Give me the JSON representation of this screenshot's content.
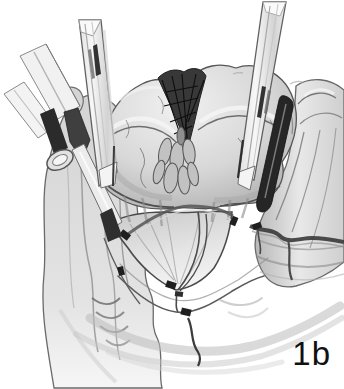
{
  "figure": {
    "label": "1b"
  },
  "illustration": {
    "description": "Grayscale hand-drawn surgical illustration: bilobed gland with dark hatched midline cleft, two tubular retractors, a clamp at upper left, a dark retractor blade at right, lateral tissue columns, fan-shaped flap with ligated vessels and surgical clips, sweeping pelvic tissue folds below",
    "elements": [
      "left-tissue-column",
      "right-tissue-column",
      "central-gland",
      "midline-incision-hatch",
      "fan-flap",
      "vessel-band",
      "surgical-clips",
      "left-clamp-instrument",
      "left-tube-retractor",
      "right-tube-retractor",
      "right-retractor-blade",
      "pelvic-floor-curves"
    ],
    "colors": {
      "background": "#ffffff",
      "outline_ink": "#4a4a4a",
      "dark_ink": "#1f1f1f",
      "tissue_light": "#efefef",
      "tissue_mid": "#c9c9c9",
      "tissue_shadow": "#8e8e8e",
      "label_text": "#111111"
    }
  }
}
